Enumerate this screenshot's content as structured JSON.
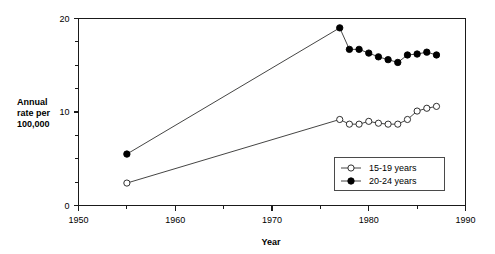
{
  "chart_data": {
    "type": "line",
    "title": "",
    "xlabel": "Year",
    "ylabel": "Annual rate per 100,000",
    "ylabel_lines": [
      "Annual",
      "rate per",
      "100,000"
    ],
    "xlim": [
      1950,
      1990
    ],
    "ylim": [
      0,
      20
    ],
    "xticks": [
      1950,
      1960,
      1970,
      1980,
      1990
    ],
    "xtick_labels": [
      "1950",
      "1960",
      "1970",
      "1980",
      "1990"
    ],
    "xminor_ticks": [
      1955,
      1965,
      1975,
      1985
    ],
    "yticks": [
      0,
      10,
      20
    ],
    "ytick_labels": [
      "0",
      "10",
      "20"
    ],
    "yminor_ticks": [
      2.5,
      5,
      7.5,
      12.5,
      15,
      17.5
    ],
    "grid": false,
    "legend_position": "lower-right",
    "series": [
      {
        "name": "15-19 years",
        "marker": "open-circle",
        "x": [
          1955,
          1977,
          1978,
          1979,
          1980,
          1981,
          1982,
          1983,
          1984,
          1985,
          1986,
          1987
        ],
        "values": [
          2.4,
          9.2,
          8.7,
          8.7,
          9.0,
          8.8,
          8.7,
          8.7,
          9.2,
          10.1,
          10.4,
          10.6
        ]
      },
      {
        "name": "20-24 years",
        "marker": "filled-circle",
        "x": [
          1955,
          1977,
          1978,
          1979,
          1980,
          1981,
          1982,
          1983,
          1984,
          1985,
          1986,
          1987
        ],
        "values": [
          5.5,
          19.0,
          16.7,
          16.7,
          16.3,
          15.9,
          15.6,
          15.3,
          16.1,
          16.2,
          16.4,
          16.1
        ]
      }
    ],
    "legend": [
      {
        "label": "15-19 years",
        "marker": "open-circle"
      },
      {
        "label": "20-24 years",
        "marker": "filled-circle"
      }
    ],
    "colors": {
      "axis": "#1a1a1a",
      "line": "#30302f",
      "open_marker_fill": "#ffffff",
      "filled_marker_fill": "#000000",
      "background": "#ffffff"
    }
  }
}
